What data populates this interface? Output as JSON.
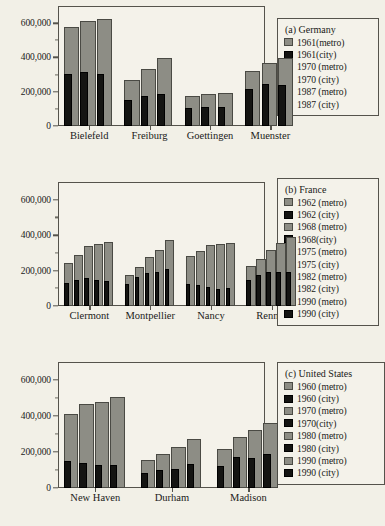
{
  "colors": {
    "background": "#f2f0e7",
    "plot_background": "#f4f2ea",
    "frame": "#55534c",
    "metro_bar": "#8d8d85",
    "city_bar": "#141412",
    "text": "#1a1a18"
  },
  "axis": {
    "y_ticks": [
      "0",
      "200,000",
      "400,000",
      "600,000"
    ],
    "y_tick_values": [
      0,
      200000,
      400000,
      600000
    ],
    "y_min": 0,
    "y_max": 700000
  },
  "chart_data": [
    {
      "type": "bar",
      "title": "(a) Germany",
      "panel": "a",
      "xlabel": "",
      "ylabel": "",
      "ylim": [
        0,
        700000
      ],
      "grid": false,
      "legend_position": "right",
      "categories": [
        "Bielefeld",
        "Freiburg",
        "Goettingen",
        "Muenster"
      ],
      "series": [
        {
          "name": "1961(metro)",
          "kind": "metro",
          "values": [
            577000,
            268000,
            177000,
            322000
          ]
        },
        {
          "name": "1961(city)",
          "kind": "city",
          "values": [
            303000,
            152000,
            103000,
            214000
          ]
        },
        {
          "name": "1970 (metro)",
          "kind": "metro",
          "values": [
            613000,
            333000,
            186000,
            369000
          ]
        },
        {
          "name": "1970 (city)",
          "kind": "city",
          "values": [
            314000,
            173000,
            111000,
            246000
          ]
        },
        {
          "name": "1987 (metro)",
          "kind": "metro",
          "values": [
            625000,
            398000,
            192000,
            394000
          ]
        },
        {
          "name": "1987 (city)",
          "kind": "city",
          "values": [
            305000,
            185000,
            110000,
            239000
          ]
        }
      ]
    },
    {
      "type": "bar",
      "title": "(b)  France",
      "panel": "b",
      "xlabel": "",
      "ylabel": "",
      "ylim": [
        0,
        700000
      ],
      "grid": false,
      "legend_position": "right",
      "categories": [
        "Clermont",
        "Montpellier",
        "Nancy",
        "Rennes"
      ],
      "series": [
        {
          "name": "1962 (metro)",
          "kind": "metro",
          "values": [
            245000,
            175000,
            281000,
            225000
          ]
        },
        {
          "name": "1962 (city)",
          "kind": "city",
          "values": [
            128000,
            124000,
            126000,
            146000
          ]
        },
        {
          "name": "1968 (metro)",
          "kind": "metro",
          "values": [
            290000,
            219000,
            313000,
            265000
          ]
        },
        {
          "name": "1968(city)",
          "kind": "city",
          "values": [
            148000,
            162000,
            121000,
            175000
          ]
        },
        {
          "name": "1975 (metro)",
          "kind": "metro",
          "values": [
            336000,
            276000,
            344000,
            319000
          ]
        },
        {
          "name": "1975 (city)",
          "kind": "city",
          "values": [
            157000,
            189000,
            108000,
            194000
          ]
        },
        {
          "name": "1982 (metro)",
          "kind": "metro",
          "values": [
            352000,
            315000,
            350000,
            353000
          ]
        },
        {
          "name": "1982 (city)",
          "kind": "city",
          "values": [
            148000,
            194000,
            98000,
            194000
          ]
        },
        {
          "name": "1990 (metro)",
          "kind": "metro",
          "values": [
            360000,
            375000,
            356000,
            390000
          ]
        },
        {
          "name": "1990 (city)",
          "kind": "city",
          "values": [
            140000,
            207000,
            101000,
            193000
          ]
        }
      ]
    },
    {
      "type": "bar",
      "title": "(c)  United States",
      "panel": "c",
      "xlabel": "",
      "ylabel": "",
      "ylim": [
        0,
        700000
      ],
      "grid": false,
      "legend_position": "right",
      "categories": [
        "New Haven",
        "Durham",
        "Madison"
      ],
      "series": [
        {
          "name": "1960 (metro)",
          "kind": "metro",
          "values": [
            411000,
            154000,
            216000
          ]
        },
        {
          "name": "1960 (city)",
          "kind": "city",
          "values": [
            152000,
            85000,
            123000
          ]
        },
        {
          "name": "1970 (metro)",
          "kind": "metro",
          "values": [
            469000,
            190000,
            285000
          ]
        },
        {
          "name": "1970(city)",
          "kind": "city",
          "values": [
            138000,
            100000,
            170000
          ]
        },
        {
          "name": "1980 (metro)",
          "kind": "metro",
          "values": [
            479000,
            226000,
            320000
          ]
        },
        {
          "name": "1980 (city)",
          "kind": "city",
          "values": [
            126000,
            105000,
            167000
          ]
        },
        {
          "name": "1990 (metro)",
          "kind": "metro",
          "values": [
            504000,
            272000,
            363000
          ]
        },
        {
          "name": "1990 (city)",
          "kind": "city",
          "values": [
            130000,
            136000,
            187000
          ]
        }
      ]
    }
  ]
}
